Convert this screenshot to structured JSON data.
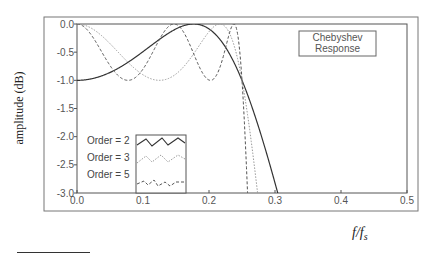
{
  "chart_data": {
    "type": "line",
    "title": "Chebyshev Response",
    "title_lines": [
      "Chebyshev",
      "Response"
    ],
    "xlabel": "f/f",
    "xlabel_sub": "s",
    "ylabel": "amplitude (dB)",
    "xlim": [
      0.0,
      0.5
    ],
    "ylim": [
      -3.0,
      0.0
    ],
    "xticks": [
      "0.0",
      "0.1",
      "0.2",
      "0.3",
      "0.4",
      "0.5"
    ],
    "yticks": [
      "0.0",
      "-0.5",
      "-1.0",
      "-1.5",
      "-2.0",
      "-2.5",
      "-3.0"
    ],
    "ripple_db": 1.0,
    "cutoff": 0.25,
    "grid": false,
    "legend_position": "lower-left",
    "series": [
      {
        "name": "Order = 2",
        "order": 2,
        "style": "solid",
        "color": "#333333"
      },
      {
        "name": "Order = 3",
        "order": 3,
        "style": "dotted",
        "color": "#999999"
      },
      {
        "name": "Order = 5",
        "order": 5,
        "style": "dashed",
        "color": "#555555"
      }
    ]
  },
  "legend": {
    "items": [
      "Order = 2",
      "Order = 3",
      "Order = 5"
    ]
  }
}
